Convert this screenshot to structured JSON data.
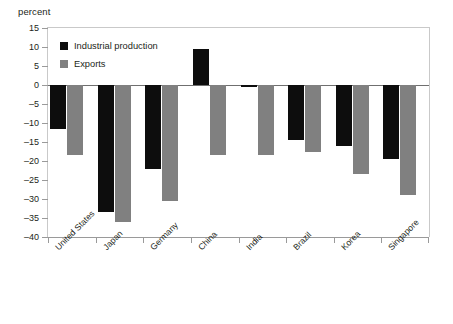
{
  "chart_data": {
    "type": "bar",
    "title": "",
    "ylabel": "percent",
    "xlabel": "",
    "ylim": [
      -40,
      15
    ],
    "ytick_step": 5,
    "yticks": [
      15,
      10,
      5,
      0,
      -5,
      -10,
      -15,
      -20,
      -25,
      -30,
      -35,
      -40
    ],
    "grid": false,
    "legend_position": "top-left",
    "categories": [
      "United States",
      "Japan",
      "Germany",
      "China",
      "India",
      "Brazil",
      "Korea",
      "Singapore"
    ],
    "series": [
      {
        "name": "Industrial production",
        "color": "#0d0d0d",
        "values": [
          -11.5,
          -33.5,
          -22.0,
          9.5,
          -0.5,
          -14.5,
          -16.0,
          -19.5
        ]
      },
      {
        "name": "Exports",
        "color": "#808080",
        "values": [
          -18.5,
          -36.0,
          -30.5,
          -18.5,
          -18.5,
          -17.5,
          -23.5,
          -29.0
        ]
      }
    ]
  }
}
